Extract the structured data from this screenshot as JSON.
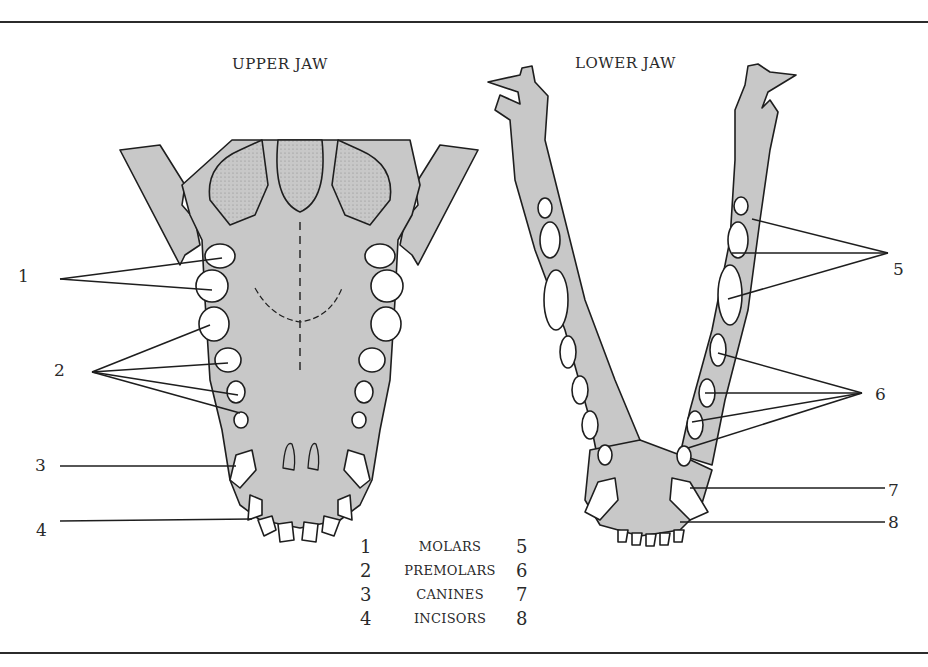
{
  "diagram": {
    "titles": {
      "upper_jaw": "UPPER JAW",
      "lower_jaw": "LOWER JAW"
    },
    "upper_jaw_callouts": [
      "1",
      "2",
      "3",
      "4"
    ],
    "lower_jaw_callouts": [
      "5",
      "6",
      "7",
      "8"
    ],
    "legend": [
      {
        "upper": "1",
        "label": "MOLARS",
        "lower": "5"
      },
      {
        "upper": "2",
        "label": "PREMOLARS",
        "lower": "6"
      },
      {
        "upper": "3",
        "label": "CANINES",
        "lower": "7"
      },
      {
        "upper": "4",
        "label": "INCISORS",
        "lower": "8"
      }
    ],
    "colors": {
      "bone_fill": "#c8c8c8",
      "tooth_fill": "#ffffff",
      "line": "#1e1e1e"
    }
  }
}
